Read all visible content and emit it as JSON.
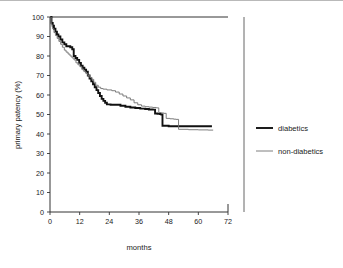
{
  "chart_data": {
    "type": "line",
    "subtype": "kaplan-meier-step",
    "title": "",
    "xlabel": "months",
    "ylabel": "primary patency (%)",
    "xlim": [
      0,
      72
    ],
    "ylim": [
      0,
      100
    ],
    "xticks": [
      0,
      12,
      24,
      36,
      48,
      60,
      72
    ],
    "xtick_labels": [
      "0",
      "12",
      "24",
      "36",
      "48",
      "60",
      "72"
    ],
    "yticks": [
      0,
      10,
      20,
      30,
      40,
      50,
      60,
      70,
      80,
      90,
      100
    ],
    "ytick_labels": [
      "0",
      "10",
      "20",
      "30",
      "40",
      "50",
      "60",
      "70",
      "80",
      "90",
      "100"
    ],
    "grid": false,
    "legend_position": "right",
    "series": [
      {
        "name": "diabetics",
        "color": "#111111",
        "line_width": 1.9,
        "points": [
          [
            0,
            100
          ],
          [
            0.6,
            97
          ],
          [
            1.1,
            95.5
          ],
          [
            1.6,
            94
          ],
          [
            2.2,
            92.5
          ],
          [
            2.8,
            91
          ],
          [
            3.4,
            90
          ],
          [
            4.2,
            88.5
          ],
          [
            5.0,
            87
          ],
          [
            5.8,
            86
          ],
          [
            6.6,
            85
          ],
          [
            7.4,
            85
          ],
          [
            8.2,
            84.5
          ],
          [
            9.0,
            83.5
          ],
          [
            9.6,
            80
          ],
          [
            10.3,
            79
          ],
          [
            11.0,
            78
          ],
          [
            11.8,
            76.5
          ],
          [
            12.5,
            75
          ],
          [
            13.2,
            74
          ],
          [
            13.9,
            73
          ],
          [
            14.6,
            72
          ],
          [
            15.3,
            70
          ],
          [
            16.0,
            68.5
          ],
          [
            16.7,
            67
          ],
          [
            17.4,
            65.5
          ],
          [
            18.1,
            64
          ],
          [
            18.8,
            62.5
          ],
          [
            19.5,
            61
          ],
          [
            20.2,
            59.5
          ],
          [
            20.9,
            58
          ],
          [
            21.6,
            57
          ],
          [
            22.3,
            56
          ],
          [
            23.0,
            55.2
          ],
          [
            24.5,
            55
          ],
          [
            26.5,
            55
          ],
          [
            28.5,
            54.5
          ],
          [
            30.5,
            54
          ],
          [
            32.5,
            53.6
          ],
          [
            34.5,
            53.3
          ],
          [
            36.5,
            53
          ],
          [
            38.5,
            52.8
          ],
          [
            40.0,
            52.6
          ],
          [
            41.5,
            52.5
          ],
          [
            42.5,
            50.5
          ],
          [
            43.5,
            50.3
          ],
          [
            44.5,
            50.2
          ],
          [
            45.0,
            50
          ],
          [
            45.5,
            44.2
          ],
          [
            48,
            44
          ],
          [
            52,
            44
          ],
          [
            56,
            44
          ],
          [
            60,
            44
          ],
          [
            64,
            44
          ],
          [
            65.5,
            44
          ]
        ]
      },
      {
        "name": "non-diabetics",
        "color": "#6f6f6f",
        "line_width": 0.9,
        "points": [
          [
            0,
            100
          ],
          [
            0.5,
            96
          ],
          [
            1.0,
            94
          ],
          [
            1.6,
            92
          ],
          [
            2.2,
            90.5
          ],
          [
            2.9,
            89
          ],
          [
            3.6,
            87.5
          ],
          [
            4.3,
            86
          ],
          [
            5.0,
            84.5
          ],
          [
            5.8,
            83
          ],
          [
            6.5,
            82
          ],
          [
            7.3,
            81
          ],
          [
            8.1,
            80
          ],
          [
            8.9,
            79
          ],
          [
            9.7,
            78
          ],
          [
            10.5,
            76.5
          ],
          [
            11.3,
            75.5
          ],
          [
            12.1,
            74.5
          ],
          [
            12.9,
            73
          ],
          [
            13.7,
            72
          ],
          [
            14.5,
            71
          ],
          [
            15.3,
            70
          ],
          [
            16.1,
            69
          ],
          [
            16.9,
            68
          ],
          [
            17.7,
            66.5
          ],
          [
            18.5,
            65
          ],
          [
            19.5,
            64
          ],
          [
            20.5,
            63.3
          ],
          [
            21.5,
            63
          ],
          [
            23,
            62.6
          ],
          [
            25,
            62.2
          ],
          [
            26.5,
            61.5
          ],
          [
            28,
            60.5
          ],
          [
            29.5,
            59.5
          ],
          [
            31,
            58.5
          ],
          [
            32.5,
            57.5
          ],
          [
            34,
            56
          ],
          [
            35.5,
            55
          ],
          [
            37,
            54.3
          ],
          [
            38.5,
            54
          ],
          [
            40,
            53.8
          ],
          [
            41.5,
            53.6
          ],
          [
            43,
            53.4
          ],
          [
            44,
            51
          ],
          [
            45,
            50.8
          ],
          [
            46,
            50.6
          ],
          [
            47,
            48
          ],
          [
            48.5,
            47.8
          ],
          [
            50,
            47.6
          ],
          [
            51,
            47.5
          ],
          [
            52,
            42.4
          ],
          [
            56,
            42.2
          ],
          [
            60,
            42.1
          ],
          [
            64,
            42
          ],
          [
            66,
            42
          ]
        ]
      }
    ]
  },
  "legend": {
    "entries": [
      {
        "label": "diabetics"
      },
      {
        "label": "non-diabetics"
      }
    ]
  },
  "axes": {
    "x_title": "months",
    "y_title": "primary patency (%)"
  }
}
